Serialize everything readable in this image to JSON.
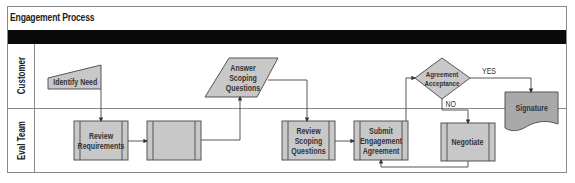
{
  "title": "Engagement Process",
  "lanes": [
    {
      "name": "Customer"
    },
    {
      "name": "Eval Team"
    }
  ],
  "nodes": {
    "identify_need": {
      "label": "Identify Need",
      "shape": "manual-input"
    },
    "review_requirements": {
      "label": "Review Requirements",
      "shape": "predefined-process"
    },
    "submit_scoping_questionnaire": {
      "label": "Submit Scoping Questionaire",
      "shape": "predefined-process"
    },
    "answer_scoping_questions": {
      "label": "Answer Scoping Questions",
      "shape": "data"
    },
    "review_scoping_questions": {
      "label": "Review Scoping Questions",
      "shape": "predefined-process"
    },
    "submit_engagement_agreement": {
      "label": "Submit Engagement Agreement",
      "shape": "predefined-process"
    },
    "agreement_acceptance": {
      "label": "Agreement Acceptance",
      "shape": "decision"
    },
    "negotiate": {
      "label": "Negotiate",
      "shape": "predefined-process"
    },
    "signature": {
      "label": "Signature",
      "shape": "document"
    }
  },
  "edge_labels": {
    "yes": "YES",
    "no": "NO"
  },
  "colors": {
    "shape_fill": "#c8c8c8",
    "shape_fill_dark": "#a9a9a9",
    "stroke": "#555555",
    "band": "#0a0a0a"
  }
}
